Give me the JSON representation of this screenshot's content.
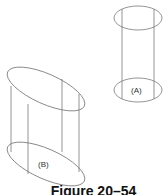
{
  "figure": {
    "caption": "Figure 20–54",
    "shapes": [
      {
        "id": "A",
        "label": "(A)",
        "type": "upright cylinder wireframe"
      },
      {
        "id": "B",
        "label": "(B)",
        "type": "oblique/tilted cylinder wireframe"
      }
    ],
    "colors": {
      "stroke": "#7a7a7a",
      "text": "#333333",
      "caption": "#111111",
      "background": "#ffffff"
    }
  }
}
